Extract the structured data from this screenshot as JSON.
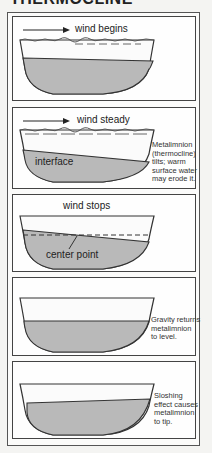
{
  "title": "THERMOCLINE",
  "colors": {
    "hypolimnion_fill": "#b9b9b9",
    "epilimnion_fill": "#fbfbfb",
    "outline": "#333333",
    "panel_border": "#444444"
  },
  "panels": [
    {
      "id": 1,
      "wind_label": "wind begins",
      "has_arrow": true,
      "note": "",
      "inner_label": ""
    },
    {
      "id": 2,
      "wind_label": "wind steady",
      "has_arrow": true,
      "note": "Metalimnion\n(thermocline)\ntilts; warm\nsurface water\nmay erode it.",
      "inner_label": "interface"
    },
    {
      "id": 3,
      "wind_label": "wind stops",
      "has_arrow": false,
      "note": "",
      "inner_label": "center point"
    },
    {
      "id": 4,
      "wind_label": "",
      "has_arrow": false,
      "note": "Gravity returns\nmetalimnion\nto level.",
      "inner_label": ""
    },
    {
      "id": 5,
      "wind_label": "",
      "has_arrow": false,
      "note": "Sloshing\neffect causes\nmetalimnion\nto tip.",
      "inner_label": ""
    }
  ]
}
